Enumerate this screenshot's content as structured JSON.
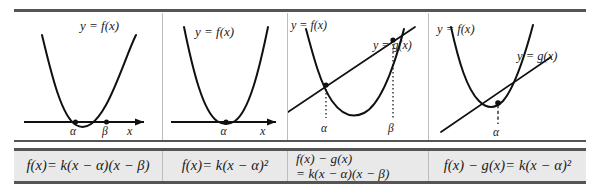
{
  "figure": {
    "rule_color": "#555555",
    "divider_color": "#bdbdbd",
    "formula_row_background": "#e9e9e9",
    "curve_color": "#101010",
    "page_background": "#ffffff"
  },
  "columns": [
    {
      "id": "col-1",
      "graph": {
        "labels": {
          "curve_f": "y = f(x)",
          "curve_g": "",
          "axis_x": "x",
          "root_first": "α",
          "root_second": "β"
        },
        "description": "Upward parabola crossing the x-axis at two points alpha and beta",
        "has_x_axis": true,
        "has_line": false,
        "roots": [
          "α",
          "β"
        ]
      },
      "formula": {
        "lines": [
          "f(x)= k(x − α)(x − β)"
        ]
      }
    },
    {
      "id": "col-2",
      "graph": {
        "labels": {
          "curve_f": "y = f(x)",
          "curve_g": "",
          "axis_x": "x",
          "root_first": "α",
          "root_second": ""
        },
        "description": "Upward parabola tangent to the x-axis at alpha (double root)",
        "has_x_axis": true,
        "has_line": false,
        "roots": [
          "α"
        ]
      },
      "formula": {
        "lines": [
          "f(x)= k(x − α)²"
        ]
      }
    },
    {
      "id": "col-3",
      "graph": {
        "labels": {
          "curve_f": "y = f(x)",
          "curve_g": "y = g(x)",
          "axis_x": "",
          "root_first": "α",
          "root_second": "β"
        },
        "description": "Upward parabola intersecting a straight line at two points alpha and beta, with dotted verticals",
        "has_x_axis": false,
        "has_line": true,
        "roots": [
          "α",
          "β"
        ]
      },
      "formula": {
        "lines": [
          "f(x) − g(x)",
          "= k(x − α)(x − β)"
        ]
      }
    },
    {
      "id": "col-4",
      "graph": {
        "labels": {
          "curve_f": "y = f(x)",
          "curve_g": "y = g(x)",
          "axis_x": "",
          "root_first": "α",
          "root_second": ""
        },
        "description": "Upward parabola tangent to a straight line at a single point alpha, with dashed vertical",
        "has_x_axis": false,
        "has_line": true,
        "roots": [
          "α"
        ]
      },
      "formula": {
        "lines": [
          "f(x) − g(x)= k(x − α)²"
        ]
      }
    }
  ]
}
